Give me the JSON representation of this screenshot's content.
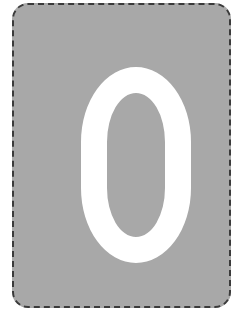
{
  "card": {
    "value": "0",
    "background_color": "#a8a8a8",
    "glyph_color": "#ffffff",
    "border_color": "#3a3a3a",
    "border_style": "dashed"
  }
}
